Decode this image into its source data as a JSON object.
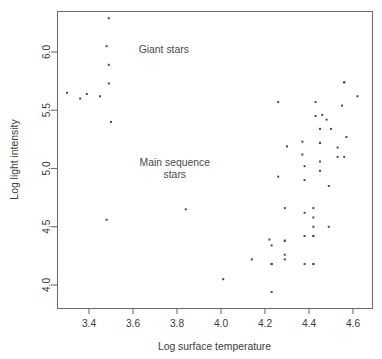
{
  "chart_data": {
    "type": "scatter",
    "title": "",
    "xlabel": "Log surface temperature",
    "ylabel": "Log light intensity",
    "xlim": [
      3.27,
      4.67
    ],
    "ylim": [
      3.88,
      6.32
    ],
    "xticks": [
      "3.4",
      "3.6",
      "3.8",
      "4.0",
      "4.2",
      "4.4",
      "4.6"
    ],
    "xtick_values": [
      3.4,
      3.6,
      3.8,
      4.0,
      4.2,
      4.4,
      4.6
    ],
    "yticks": [
      "4.0",
      "4.5",
      "5.0",
      "5.5",
      "6.0"
    ],
    "ytick_values": [
      4.0,
      4.5,
      5.0,
      5.5,
      6.0
    ],
    "grid": false,
    "legend": "none",
    "marker": "square",
    "marker_color": "#4b4b4b",
    "marker_size": 2.0,
    "annotations": [
      {
        "name": "giant-stars-label",
        "lines": [
          "Giant stars"
        ],
        "x": 3.74,
        "y": 5.99
      },
      {
        "name": "main-sequence-label",
        "lines": [
          "Main sequence",
          "stars"
        ],
        "x": 3.79,
        "y": 5.02
      }
    ],
    "series": [
      {
        "name": "stars",
        "points": [
          [
            4.37,
            5.23
          ],
          [
            4.56,
            5.74
          ],
          [
            4.26,
            4.93
          ],
          [
            4.56,
            5.74
          ],
          [
            4.3,
            5.19
          ],
          [
            4.46,
            5.46
          ],
          [
            3.84,
            4.65
          ],
          [
            4.57,
            5.27
          ],
          [
            4.26,
            5.57
          ],
          [
            4.37,
            5.12
          ],
          [
            3.49,
            5.73
          ],
          [
            4.43,
            5.45
          ],
          [
            4.48,
            5.42
          ],
          [
            4.01,
            4.05
          ],
          [
            4.29,
            4.26
          ],
          [
            4.42,
            4.58
          ],
          [
            4.23,
            3.94
          ],
          [
            4.42,
            4.18
          ],
          [
            4.23,
            4.18
          ],
          [
            3.49,
            5.89
          ],
          [
            4.29,
            4.38
          ],
          [
            4.29,
            4.22
          ],
          [
            4.42,
            4.42
          ],
          [
            4.49,
            4.85
          ],
          [
            4.38,
            5.02
          ],
          [
            4.42,
            4.66
          ],
          [
            4.29,
            4.66
          ],
          [
            4.38,
            4.9
          ],
          [
            4.22,
            4.39
          ],
          [
            3.48,
            6.05
          ],
          [
            4.38,
            4.42
          ],
          [
            4.56,
            5.1
          ],
          [
            4.45,
            5.22
          ],
          [
            3.49,
            6.29
          ],
          [
            4.23,
            4.34
          ],
          [
            4.62,
            5.62
          ],
          [
            4.53,
            5.1
          ],
          [
            4.45,
            5.22
          ],
          [
            4.53,
            5.18
          ],
          [
            4.43,
            5.57
          ],
          [
            4.38,
            4.62
          ],
          [
            4.45,
            5.06
          ],
          [
            4.5,
            5.34
          ],
          [
            4.45,
            5.34
          ],
          [
            4.55,
            5.54
          ],
          [
            4.45,
            4.98
          ],
          [
            4.42,
            4.5
          ],
          [
            4.49,
            4.5
          ],
          [
            4.38,
            4.18
          ],
          [
            4.42,
            4.18
          ],
          [
            4.29,
            4.38
          ],
          [
            4.14,
            4.22
          ],
          [
            3.48,
            4.56
          ],
          [
            4.23,
            4.18
          ],
          [
            4.42,
            4.42
          ],
          [
            3.45,
            5.62
          ],
          [
            3.36,
            5.6
          ],
          [
            3.39,
            5.64
          ],
          [
            3.3,
            5.65
          ],
          [
            3.5,
            5.4
          ]
        ]
      }
    ]
  },
  "plot_geometry": {
    "frame": {
      "x": 57,
      "y": 11,
      "width": 315,
      "height": 297
    },
    "x_axis_px": {
      "v1": 3.4,
      "px1": 89,
      "v2": 4.6,
      "px2": 353
    },
    "y_axis_px": {
      "v1": 4.0,
      "px1": 285,
      "v2": 6.0,
      "px2": 52
    }
  }
}
